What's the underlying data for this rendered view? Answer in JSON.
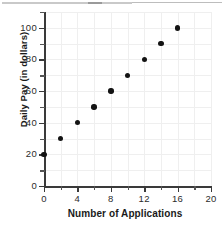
{
  "figure": {
    "background_color": "#ffffff",
    "point_color": "#131313",
    "grid_color": "#efefef",
    "axis_color": "#3a3a3a"
  },
  "chart_data": {
    "type": "scatter",
    "title": "",
    "xlabel": "Number of Applications",
    "ylabel": "Daily Pay (in dollars)",
    "xlim": [
      0,
      20
    ],
    "ylim": [
      0,
      110
    ],
    "grid": true,
    "legend": "none",
    "x_ticks": [
      0,
      4,
      8,
      12,
      16,
      20
    ],
    "x_tick_labels": [
      "0",
      "4",
      "8",
      "12",
      "16",
      "20"
    ],
    "x_minor_ticks": [
      2,
      6,
      10,
      14,
      18
    ],
    "y_ticks": [
      0,
      20,
      40,
      60,
      80,
      100
    ],
    "y_tick_labels": [
      "0",
      "20",
      "40",
      "60",
      "80",
      "100"
    ],
    "y_minor_ticks": [
      10,
      30,
      50,
      70,
      90,
      110
    ],
    "x": [
      0,
      2,
      4,
      6,
      8,
      10,
      12,
      14,
      16
    ],
    "y": [
      20,
      30,
      40,
      50,
      60,
      70,
      80,
      90,
      100
    ],
    "points": [
      {
        "x": 0,
        "y": 20
      },
      {
        "x": 2,
        "y": 30
      },
      {
        "x": 4,
        "y": 40
      },
      {
        "x": 6,
        "y": 50
      },
      {
        "x": 8,
        "y": 60
      },
      {
        "x": 10,
        "y": 70
      },
      {
        "x": 12,
        "y": 80
      },
      {
        "x": 14,
        "y": 90
      },
      {
        "x": 16,
        "y": 100
      }
    ]
  }
}
